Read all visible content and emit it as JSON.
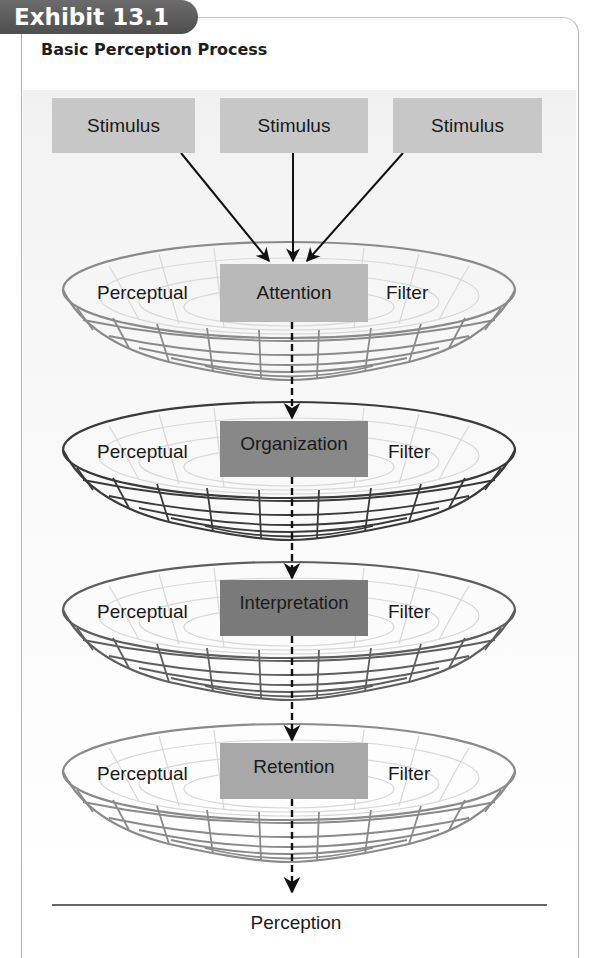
{
  "exhibit": {
    "label": "Exhibit 13.1",
    "title": "Basic Perception Process"
  },
  "stimuli": [
    {
      "label": "Stimulus"
    },
    {
      "label": "Stimulus"
    },
    {
      "label": "Stimulus"
    }
  ],
  "stages": [
    {
      "left_label": "Perceptual",
      "center_label": "Attention",
      "right_label": "Filter",
      "box_color": "#b9b9b9",
      "rim_color": "#8a8a8a"
    },
    {
      "left_label": "Perceptual",
      "center_label": "Organization",
      "right_label": "Filter",
      "box_color": "#8a8a8a",
      "rim_color": "#2a2a2a"
    },
    {
      "left_label": "Perceptual",
      "center_label": "Interpretation",
      "right_label": "Filter",
      "box_color": "#7a7a7a",
      "rim_color": "#555555"
    },
    {
      "left_label": "Perceptual",
      "center_label": "Retention",
      "right_label": "Filter",
      "box_color": "#a8a8a8",
      "rim_color": "#8a8a8a"
    }
  ],
  "output": {
    "label": "Perception"
  },
  "colors": {
    "tab": "#5a5a5a",
    "stimulus_box": "#c7c7c7",
    "frame": "#b4b4b4",
    "arrow": "#111111"
  }
}
